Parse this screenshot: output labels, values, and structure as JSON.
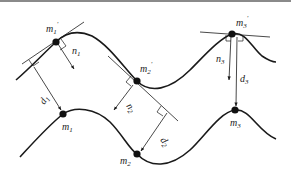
{
  "diagram": {
    "type": "point-to-curve distance correspondence",
    "curves": [
      {
        "name": "upper-curve",
        "description": "transformed curve with points m1', m2', m3'"
      },
      {
        "name": "lower-curve",
        "description": "reference curve with points m1, m2, m3"
      }
    ],
    "labels": {
      "m1p": "m",
      "m1p_sub": "1",
      "m1p_prime": "′",
      "m2p": "m",
      "m2p_sub": "2",
      "m2p_prime": "′",
      "m3p": "m",
      "m3p_sub": "3",
      "m3p_prime": "′",
      "m1": "m",
      "m1_sub": "1",
      "m2": "m",
      "m2_sub": "2",
      "m3": "m",
      "m3_sub": "3",
      "n1": "n",
      "n1_sub": "1",
      "n2": "n",
      "n2_sub": "2",
      "n3": "n",
      "n3_sub": "3",
      "d1": "d",
      "d1_sub": "1",
      "d2": "d",
      "d2_sub": "2",
      "d3": "d",
      "d3_sub": "3"
    },
    "points": [
      {
        "id": "m1'",
        "x": 56,
        "y": 42
      },
      {
        "id": "m2'",
        "x": 137,
        "y": 81
      },
      {
        "id": "m3'",
        "x": 232,
        "y": 34
      },
      {
        "id": "m1",
        "x": 63,
        "y": 114
      },
      {
        "id": "m2",
        "x": 137,
        "y": 154
      },
      {
        "id": "m3",
        "x": 235,
        "y": 110
      }
    ],
    "colors": {
      "stroke": "#1a1a1a",
      "background": "#ffffff",
      "top_rule": "#8a8a8a"
    }
  }
}
